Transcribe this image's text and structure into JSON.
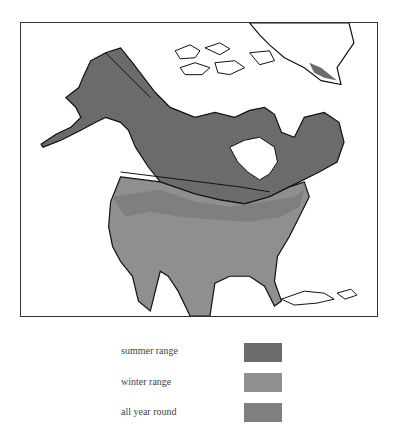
{
  "map": {
    "colors": {
      "summer_range": "#6b6b6b",
      "winter_range": "#8f8f8f",
      "all_year_round": "#7f7f7f",
      "land_outline": "#111111",
      "water": "#ffffff",
      "frame": "#333333"
    },
    "regions": [
      "Alaska",
      "Canada",
      "United States",
      "Mexico",
      "Greenland",
      "Caribbean"
    ]
  },
  "legend": {
    "items": [
      {
        "label": "summer range",
        "color": "#6b6b6b"
      },
      {
        "label": "winter range",
        "color": "#8f8f8f"
      },
      {
        "label": "all year round",
        "color": "#7f7f7f"
      }
    ]
  }
}
